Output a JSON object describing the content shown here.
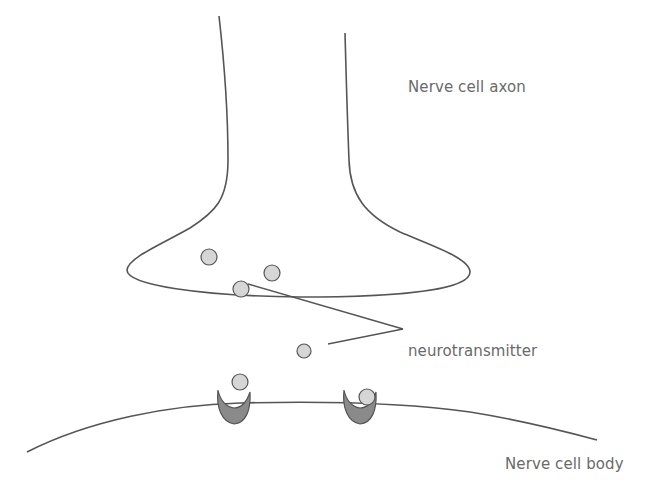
{
  "labels": {
    "axon": "Nerve cell axon",
    "neurotransmitter": "neurotransmitter",
    "body": "Nerve cell body"
  },
  "colors": {
    "stroke": "#555555",
    "vesicle_fill": "#d6d6d6",
    "receptor_fill": "#8a8a8a",
    "text": "#6a6a6a",
    "background": "#ffffff"
  },
  "vesicles": [
    {
      "cx": 209,
      "cy": 257,
      "r": 8
    },
    {
      "cx": 272,
      "cy": 273,
      "r": 8
    },
    {
      "cx": 241,
      "cy": 289,
      "r": 8
    },
    {
      "cx": 304,
      "cy": 351,
      "r": 7
    },
    {
      "cx": 240,
      "cy": 382,
      "r": 8
    },
    {
      "cx": 367,
      "cy": 397,
      "r": 8
    }
  ]
}
